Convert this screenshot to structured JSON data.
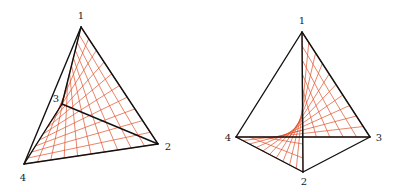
{
  "figures": [
    {
      "name": "tetrahedron-left",
      "vertices": {
        "1": [
          81,
          27
        ],
        "2": [
          158,
          144
        ],
        "3": [
          62,
          104
        ],
        "4": [
          24,
          164
        ]
      },
      "edges": [
        [
          "1",
          "2"
        ],
        [
          "1",
          "4"
        ],
        [
          "1",
          "3"
        ],
        [
          "2",
          "4"
        ],
        [
          "3",
          "2"
        ],
        [
          "3",
          "4"
        ]
      ],
      "labels": [
        {
          "text": "1",
          "pos": [
            81,
            16
          ]
        },
        {
          "text": "2",
          "pos": [
            168,
            147
          ]
        },
        {
          "text": "3",
          "pos": [
            56,
            99
          ]
        },
        {
          "text": "4",
          "pos": [
            23,
            178
          ]
        }
      ],
      "ruled_surface": {
        "corners": [
          "1",
          "2",
          "3",
          "4"
        ],
        "divisions": 10
      }
    },
    {
      "name": "tetrahedron-right",
      "vertices": {
        "1": [
          302,
          32
        ],
        "2": [
          303,
          172
        ],
        "3": [
          370,
          137
        ],
        "4": [
          236,
          137
        ]
      },
      "edges": [
        [
          "1",
          "4"
        ],
        [
          "1",
          "3"
        ],
        [
          "1",
          "2"
        ],
        [
          "4",
          "3"
        ],
        [
          "4",
          "2"
        ],
        [
          "2",
          "3"
        ]
      ],
      "labels": [
        {
          "text": "1",
          "pos": [
            302,
            21
          ]
        },
        {
          "text": "2",
          "pos": [
            304,
            182
          ]
        },
        {
          "text": "3",
          "pos": [
            379,
            138
          ]
        },
        {
          "text": "4",
          "pos": [
            228,
            138
          ]
        }
      ],
      "ruled_surface": {
        "corners": [
          "1",
          "3",
          "2",
          "4"
        ],
        "divisions": 10
      }
    }
  ],
  "colors": {
    "edge": "#111111",
    "ruling": "#e0502a"
  }
}
